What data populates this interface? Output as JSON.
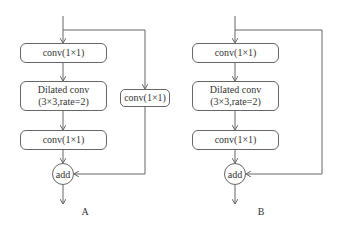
{
  "diagram": {
    "panels": [
      {
        "id": "A",
        "label": "A",
        "main_path": [
          {
            "label": "conv(1×1)"
          },
          {
            "label_line1": "Dilated conv",
            "label_line2": "(3×3,rate=2)"
          },
          {
            "label": "conv(1×1)"
          }
        ],
        "skip_path": [
          {
            "label": "conv(1×1)"
          }
        ],
        "merge": "add"
      },
      {
        "id": "B",
        "label": "B",
        "main_path": [
          {
            "label": "conv(1×1)"
          },
          {
            "label_line1": "Dilated conv",
            "label_line2": "(3×3,rate=2)"
          },
          {
            "label": "conv(1×1)"
          }
        ],
        "skip_path": [],
        "merge": "add"
      }
    ],
    "colors": {
      "line": "#666666",
      "text": "#333333",
      "background": "#ffffff"
    }
  }
}
